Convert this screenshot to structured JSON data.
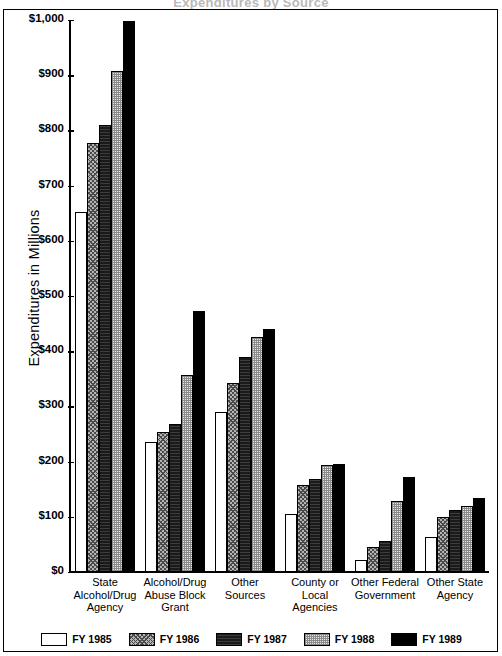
{
  "scan": {
    "cut_off_header": "Expenditures by Source"
  },
  "chart_data": {
    "type": "bar",
    "title": "",
    "xlabel": "",
    "ylabel": "Expenditures in Millions",
    "ylim": [
      0,
      1000
    ],
    "ytick_labels": [
      "$1,000",
      "$900",
      "$800",
      "$700",
      "$600",
      "$500",
      "$400",
      "$300",
      "$200",
      "$100",
      "$0"
    ],
    "ytick_values": [
      1000,
      900,
      800,
      700,
      600,
      500,
      400,
      300,
      200,
      100,
      0
    ],
    "grid": false,
    "legend_position": "bottom",
    "categories": [
      "State Alcohol/Drug Agency",
      "Alcohol/Drug Abuse Block Grant",
      "Other Sources",
      "County or Local Agencies",
      "Other Federal Government",
      "Other State Agency"
    ],
    "category_lines": [
      [
        "State",
        "Alcohol/Drug",
        "Agency"
      ],
      [
        "Alcohol/Drug",
        "Abuse Block",
        "Grant"
      ],
      [
        "Other",
        "Sources"
      ],
      [
        "County or",
        "Local",
        "Agencies"
      ],
      [
        "Other Federal",
        "Government"
      ],
      [
        "Other State",
        "Agency"
      ]
    ],
    "series": [
      {
        "name": "FY 1985",
        "swatch": "white",
        "color": "#ffffff",
        "values": [
          652,
          236,
          290,
          106,
          22,
          63
        ]
      },
      {
        "name": "FY 1986",
        "swatch": "gray-hatch",
        "color": "#b4b4b4",
        "values": [
          777,
          254,
          342,
          157,
          45,
          100
        ]
      },
      {
        "name": "FY 1987",
        "swatch": "dark-hatch",
        "color": "#1a1a1a",
        "values": [
          810,
          269,
          390,
          168,
          56,
          113
        ]
      },
      {
        "name": "FY 1988",
        "swatch": "light-check",
        "color": "#e8e8e8",
        "values": [
          907,
          357,
          426,
          193,
          128,
          120
        ]
      },
      {
        "name": "FY 1989",
        "swatch": "solid-black",
        "color": "#000000",
        "values": [
          998,
          473,
          441,
          195,
          172,
          134
        ]
      }
    ]
  }
}
